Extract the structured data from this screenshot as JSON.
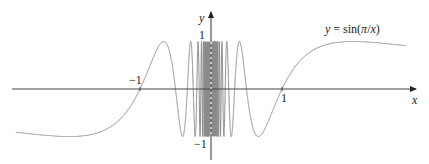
{
  "chart_data": {
    "type": "line",
    "title": "",
    "function": "y = sin(pi/x)",
    "annotation": {
      "text_prefix": "y = sin(",
      "text_pi": "π",
      "text_suffix": "/x)"
    },
    "xlabel": "x",
    "ylabel": "y",
    "xlim": [
      -2.9,
      3.0
    ],
    "ylim": [
      -1.5,
      1.5
    ],
    "x_ticks": [
      {
        "value": -1,
        "label": "−1"
      },
      {
        "value": 1,
        "label": "1"
      }
    ],
    "y_ticks": [
      {
        "value": 1,
        "label": "1"
      },
      {
        "value": -1,
        "label": "−1"
      }
    ],
    "series": [
      {
        "name": "sin(pi/x)",
        "x_range": [
          -2.75,
          2.75
        ],
        "color": "#8a8a8a"
      }
    ],
    "grid": false,
    "legend": "none"
  }
}
